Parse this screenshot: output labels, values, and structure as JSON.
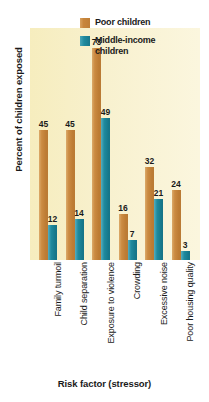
{
  "chart_data": {
    "type": "bar",
    "title": "",
    "xlabel": "Risk factor (stressor)",
    "ylabel": "Percent of children exposed",
    "ylim": [
      0,
      80
    ],
    "grid": false,
    "legend_position": "top-right",
    "categories": [
      "Family turmoil",
      "Child separation",
      "Exposure to violence",
      "Crowding",
      "Excessive noise",
      "Poor housing quality"
    ],
    "series": [
      {
        "name": "Poor children",
        "color": "#c8863c",
        "values": [
          45,
          45,
          73,
          16,
          32,
          24
        ]
      },
      {
        "name": "Middle-income children",
        "color": "#1f8a9e",
        "values": [
          12,
          14,
          49,
          7,
          21,
          3
        ]
      }
    ]
  },
  "legend": {
    "items": [
      {
        "label": "Poor children"
      },
      {
        "label": "Middle-income children"
      }
    ]
  },
  "colors": {
    "poor": "#c8863c",
    "middle": "#1f8a9e",
    "panel_background": "#f7efc6",
    "text": "#1a1a1a"
  }
}
